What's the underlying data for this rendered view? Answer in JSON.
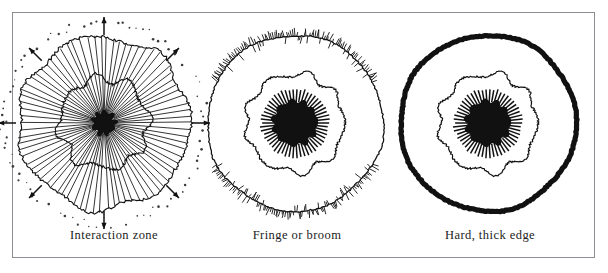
{
  "figure": {
    "background_color": "#ffffff",
    "frame": {
      "border_color": "#8d8d93",
      "border_width": 1,
      "x": 12,
      "y": 12,
      "width": 583,
      "height": 246
    },
    "ink_color": "#111111",
    "caption_color": "#1b1b1b",
    "caption_font_size": 12.5,
    "caption_y": 215
  },
  "panels": [
    {
      "id": "interaction-zone",
      "caption": "Interaction zone",
      "center": {
        "x": 103,
        "y": 110
      },
      "core": {
        "radius": 11,
        "fill": "#111111",
        "wobble": 0.16,
        "lobes": 9
      },
      "inner_contour": {
        "radius": 45,
        "stroke_width": 1.1,
        "wobble": 0.085,
        "lobes": 8,
        "roughness": 0.028
      },
      "outer_contour": {
        "radius": 86,
        "stroke_width": 1.1,
        "wobble": 0.035,
        "lobes": 7,
        "roughness": 0.016
      },
      "spokes": {
        "count": 78,
        "inner_radius": 10,
        "outer_radius": 86,
        "stroke_width": 0.85,
        "jitter": 0.035
      },
      "dotted_ring": {
        "radius": 101,
        "dot_count": 96,
        "dot_radius": 0.95,
        "radial_scatter": 4.0,
        "fill": "#3a3a3a"
      },
      "arrows": {
        "count": 8,
        "tail_radius": 88,
        "head_radius": 106,
        "shaft_width": 1.5,
        "head_size": 5.0,
        "angles_deg": [
          90,
          135,
          180,
          225,
          270,
          315,
          0,
          45
        ]
      }
    },
    {
      "id": "fringe-or-broom",
      "caption": "Fringe or broom",
      "center": {
        "x": 296,
        "y": 110
      },
      "core": {
        "radius": 22,
        "fill": "#111111",
        "wobble": 0.07,
        "lobes": 11
      },
      "core_spokes": {
        "count": 54,
        "inner_radius": 21,
        "outer_radius": 34,
        "stroke_width": 1.5
      },
      "middle_contour": {
        "radius": 49,
        "stroke_width": 1.2,
        "wobble": 0.055,
        "lobes": 9,
        "roughness": 0.02
      },
      "outer_contour": {
        "radius": 88,
        "stroke_width": 1.25,
        "wobble": 0.012,
        "lobes": 5,
        "roughness": 0.008
      },
      "fringe": {
        "segments": [
          {
            "start_deg": 28,
            "end_deg": 152
          },
          {
            "start_deg": 208,
            "end_deg": 332
          }
        ],
        "bristle_count": 210,
        "length_min": 3.5,
        "length_max": 8.5,
        "stroke_width": 0.9,
        "angle_jitter_deg": 16
      }
    },
    {
      "id": "hard-thick-edge",
      "caption": "Hard, thick edge",
      "center": {
        "x": 489,
        "y": 110
      },
      "core": {
        "radius": 22,
        "fill": "#111111",
        "wobble": 0.07,
        "lobes": 11
      },
      "core_spokes": {
        "count": 54,
        "inner_radius": 21,
        "outer_radius": 34,
        "stroke_width": 1.5
      },
      "middle_contour": {
        "radius": 49,
        "stroke_width": 1.2,
        "wobble": 0.055,
        "lobes": 9,
        "roughness": 0.02
      },
      "outer_contour": {
        "radius": 88,
        "stroke_width": 5.2,
        "wobble": 0.01,
        "lobes": 5,
        "roughness": 0.006
      }
    }
  ]
}
